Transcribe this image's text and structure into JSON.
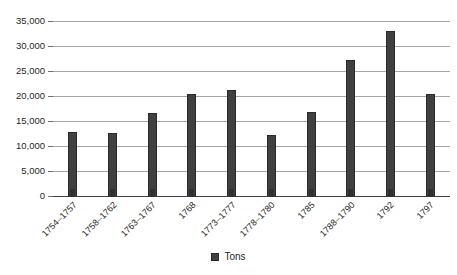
{
  "chart_data": {
    "type": "bar",
    "title": "",
    "subtitle": "",
    "xlabel": "",
    "ylabel": "",
    "ylim": [
      0,
      35000
    ],
    "ytick_step": 5000,
    "ytick_labels": [
      "35,000",
      "30,000",
      "25,000",
      "20,000",
      "15,000",
      "10,000",
      "5,000",
      "0"
    ],
    "ytick_values": [
      35000,
      30000,
      25000,
      20000,
      15000,
      10000,
      5000,
      0
    ],
    "grid": true,
    "legend_position": "bottom",
    "categories": [
      "1754–1757",
      "1758–1762",
      "1763–1767",
      "1768",
      "1773–1777",
      "1778–1780",
      "1785",
      "1788–1790",
      "1792",
      "1797"
    ],
    "series": [
      {
        "name": "Tons",
        "color": "#404040",
        "values": [
          12800,
          12600,
          16600,
          20400,
          21200,
          12300,
          16800,
          27300,
          33100,
          20500
        ]
      }
    ]
  },
  "legend": {
    "entries": [
      {
        "label": "Tons",
        "color": "#404040",
        "swatch": "square-marker"
      }
    ]
  },
  "colors": {
    "bar_fill": "#404040",
    "bar_stroke": "#2b2b2b",
    "gridline": "#a6a6a6",
    "axis": "#3f3f3f",
    "text": "#1f1f1f",
    "background": "#ffffff"
  }
}
